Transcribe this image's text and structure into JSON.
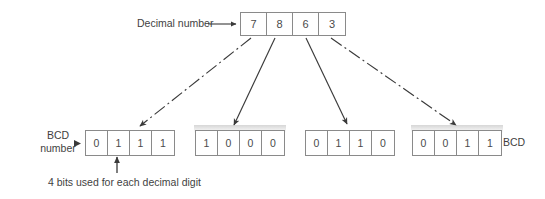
{
  "diagram": {
    "background_color": "#ffffff",
    "line_color": "#3a3a3a",
    "box_border_color": "#8a8a8a"
  },
  "decimal": {
    "label": "Decimal number",
    "digits": [
      "7",
      "8",
      "6",
      "3"
    ]
  },
  "bcd": {
    "left_label": "BCD\nnumber",
    "right_label": "BCD",
    "groups": [
      {
        "digit": "7",
        "bits": [
          "0",
          "1",
          "1",
          "1"
        ]
      },
      {
        "digit": "8",
        "bits": [
          "1",
          "0",
          "0",
          "0"
        ]
      },
      {
        "digit": "6",
        "bits": [
          "0",
          "1",
          "1",
          "0"
        ]
      },
      {
        "digit": "3",
        "bits": [
          "0",
          "0",
          "1",
          "1"
        ]
      }
    ]
  },
  "caption": {
    "text": "4 bits used for each decimal digit"
  },
  "connectors": [
    {
      "name": "connector-7",
      "style": "dash-dot",
      "from_digit": "7",
      "to_group": 0
    },
    {
      "name": "connector-8",
      "style": "solid",
      "from_digit": "8",
      "to_group": 1
    },
    {
      "name": "connector-6",
      "style": "solid",
      "from_digit": "6",
      "to_group": 2
    },
    {
      "name": "connector-3",
      "style": "dash-dot",
      "from_digit": "3",
      "to_group": 3
    }
  ]
}
